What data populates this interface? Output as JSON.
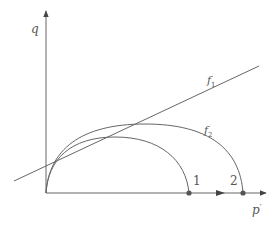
{
  "diagram": {
    "axes": {
      "y_label": "q",
      "x_label": "p",
      "x_label_prime": "′"
    },
    "lines": [
      {
        "name": "f",
        "subscript": "1",
        "kind": "straight line"
      },
      {
        "name": "f",
        "subscript": "2",
        "kind": "arc"
      }
    ],
    "points": [
      {
        "label": "1"
      },
      {
        "label": "2"
      }
    ],
    "colors": {
      "stroke": "#666666",
      "point": "#555555",
      "text": "#555555"
    }
  }
}
